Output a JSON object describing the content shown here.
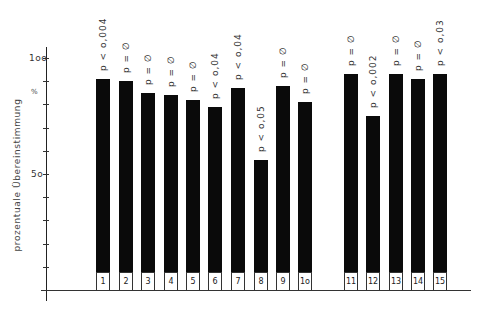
{
  "chart_data": {
    "type": "bar",
    "title": "",
    "xlabel": "",
    "ylabel": "prozentuale Übereinstimmung",
    "y_unit_marker": "%",
    "ylim": [
      0,
      100
    ],
    "yticks": [
      10,
      20,
      30,
      40,
      50,
      60,
      70,
      80,
      90,
      100
    ],
    "ytick_labels": [
      {
        "value": 100,
        "label": "1oo"
      },
      {
        "value": 50,
        "label": "5o"
      }
    ],
    "grid": false,
    "legend": null,
    "categories": [
      "1",
      "2",
      "3",
      "4",
      "5",
      "6",
      "7",
      "8",
      "9",
      "1o",
      "11",
      "12",
      "13",
      "14",
      "15"
    ],
    "values": [
      91,
      90,
      85,
      84,
      82,
      79,
      87,
      56,
      88,
      81,
      93,
      75,
      93,
      91,
      93
    ],
    "annotations": [
      "p < o,004",
      "p = ∅",
      "p = ∅",
      "p = ∅",
      "p = ∅",
      "p < o,04",
      "p < o,04",
      "p < o,05",
      "p = ∅",
      "p = ∅",
      "p = ∅",
      "p < o,002",
      "p = ∅",
      "p = ∅",
      "p < o,03"
    ],
    "bar_color": "#0a0a0a"
  }
}
